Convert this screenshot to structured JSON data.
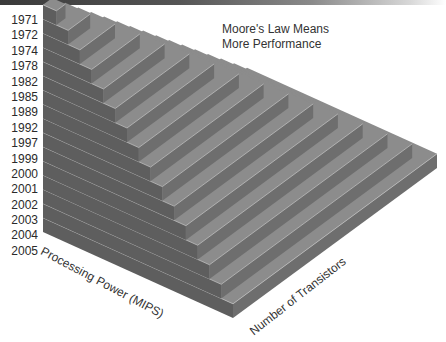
{
  "title": {
    "line1": "Moore's Law Means",
    "line2": "More Performance"
  },
  "axes": {
    "left_label": "Processing Power (MIPS)",
    "right_label": "Number of Transistors"
  },
  "years": [
    "1971",
    "1972",
    "1974",
    "1978",
    "1982",
    "1985",
    "1989",
    "1992",
    "1997",
    "1999",
    "2000",
    "2001",
    "2002",
    "2003",
    "2004",
    "2005"
  ],
  "colors": {
    "top_face": "#8c8c8c",
    "left_face": "#5e5e5e",
    "right_face": "#6e6e6e",
    "edge_highlight": "#bdbdbd",
    "background": "#ffffff"
  }
}
